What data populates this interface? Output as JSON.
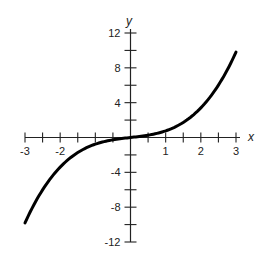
{
  "chart_data": {
    "type": "line",
    "title": "",
    "xlabel": "x",
    "ylabel": "y",
    "xlim": [
      -3,
      3
    ],
    "ylim": [
      -12,
      12
    ],
    "grid": false,
    "legend": null,
    "x_ticks": [
      -3,
      -2.5,
      -2,
      -1.5,
      -1,
      -0.5,
      0,
      0.5,
      1,
      1.5,
      2,
      2.5,
      3
    ],
    "x_tick_labels": [
      {
        "value": -3,
        "label": "-3"
      },
      {
        "value": -2,
        "label": "-2"
      },
      {
        "value": 1,
        "label": "1"
      },
      {
        "value": 2,
        "label": "2"
      },
      {
        "value": 3,
        "label": "3"
      }
    ],
    "y_ticks": [
      -12,
      -10,
      -8,
      -6,
      -4,
      -2,
      0,
      2,
      4,
      6,
      8,
      10,
      12
    ],
    "y_tick_labels": [
      {
        "value": 12,
        "label": "12"
      },
      {
        "value": 8,
        "label": "8"
      },
      {
        "value": 4,
        "label": "4"
      },
      {
        "value": -4,
        "label": "-4"
      },
      {
        "value": -8,
        "label": "-8"
      },
      {
        "value": -12,
        "label": "-12"
      }
    ],
    "series": [
      {
        "name": "cubic curve",
        "x": [
          -3,
          -2.5,
          -2,
          -1.5,
          -1,
          -0.5,
          0,
          0.5,
          1,
          1.5,
          2,
          2.5,
          3
        ],
        "y": [
          -9.8,
          -6.0,
          -3.4,
          -1.7,
          -0.8,
          -0.3,
          0,
          0.3,
          0.8,
          1.7,
          3.4,
          6.0,
          9.8
        ]
      }
    ],
    "colors": {
      "curve": "#000000",
      "axis": "#222222"
    }
  }
}
